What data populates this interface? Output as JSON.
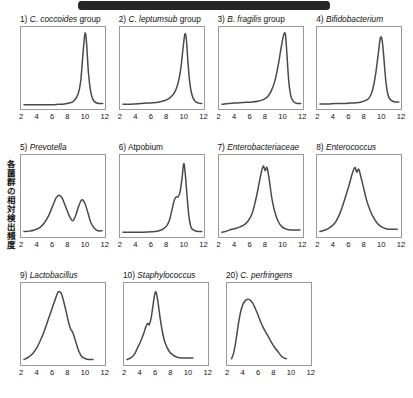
{
  "figure": {
    "y_axis_label": "各菌群の相対検出頻度",
    "x_ticks": [
      "2",
      "4",
      "6",
      "8",
      "10",
      "12"
    ],
    "curve_color": "#4a4a4a",
    "frame_color": "#9a9a9a",
    "artifact_color": "#262626"
  },
  "chart_data": {
    "type": "line",
    "title": "",
    "xlabel": "",
    "ylabel": "各菌群の相対検出頻度",
    "xlim": [
      1.4,
      12.6
    ],
    "ylim": [
      0,
      1
    ],
    "grid": false,
    "legend": "none",
    "panel_layout": [
      4,
      4,
      3
    ],
    "panels": [
      {
        "index": "1)",
        "taxon": "C. coccoides",
        "suffix": " group",
        "italic_part": "C. coccoides",
        "x": [
          1.8,
          2.5,
          3.2,
          4.0,
          4.8,
          5.6,
          6.4,
          7.2,
          8.0,
          8.5,
          9.0,
          9.35,
          9.6,
          9.85,
          10.0,
          10.15,
          10.4,
          10.7,
          11.0,
          11.4,
          11.9,
          12.3
        ],
        "y": [
          0.035,
          0.035,
          0.035,
          0.035,
          0.035,
          0.035,
          0.04,
          0.045,
          0.06,
          0.09,
          0.17,
          0.33,
          0.62,
          0.9,
          0.96,
          0.82,
          0.44,
          0.2,
          0.1,
          0.06,
          0.05,
          0.05
        ]
      },
      {
        "index": "2)",
        "taxon": "C. leptumsub",
        "suffix": " group",
        "italic_part": "C. leptumsub",
        "x": [
          1.8,
          2.6,
          3.4,
          4.2,
          5.0,
          5.8,
          6.6,
          7.4,
          8.0,
          8.6,
          9.1,
          9.5,
          9.8,
          10.05,
          10.25,
          10.45,
          10.7,
          11.0,
          11.4,
          11.9,
          12.3
        ],
        "y": [
          0.04,
          0.04,
          0.045,
          0.05,
          0.055,
          0.06,
          0.07,
          0.09,
          0.12,
          0.18,
          0.3,
          0.5,
          0.76,
          0.95,
          0.88,
          0.6,
          0.32,
          0.16,
          0.08,
          0.055,
          0.05
        ]
      },
      {
        "index": "3)",
        "taxon": "B. fragilis",
        "suffix": " group",
        "italic_part": "B. fragilis",
        "x": [
          1.8,
          2.6,
          3.4,
          4.2,
          5.0,
          5.8,
          6.6,
          7.3,
          7.9,
          8.4,
          8.9,
          9.3,
          9.7,
          10.0,
          10.25,
          10.45,
          10.7,
          11.0,
          11.4,
          11.9,
          12.3
        ],
        "y": [
          0.04,
          0.05,
          0.055,
          0.06,
          0.065,
          0.07,
          0.08,
          0.1,
          0.14,
          0.22,
          0.36,
          0.55,
          0.78,
          0.93,
          0.95,
          0.7,
          0.34,
          0.14,
          0.07,
          0.05,
          0.05
        ]
      },
      {
        "index": "4)",
        "taxon": "Bifidobacterium",
        "suffix": "",
        "italic_part": "Bifidobacterium",
        "x": [
          1.8,
          2.8,
          3.8,
          4.8,
          5.8,
          6.6,
          7.3,
          7.9,
          8.4,
          8.8,
          9.2,
          9.55,
          9.85,
          10.1,
          10.35,
          10.6,
          10.9,
          11.3,
          11.8,
          12.3
        ],
        "y": [
          0.045,
          0.045,
          0.05,
          0.05,
          0.055,
          0.06,
          0.07,
          0.09,
          0.13,
          0.22,
          0.42,
          0.68,
          0.9,
          0.86,
          0.6,
          0.32,
          0.15,
          0.09,
          0.07,
          0.07
        ]
      },
      {
        "index": "5)",
        "taxon": "Prevotella",
        "suffix": "",
        "italic_part": "Prevotella",
        "x": [
          1.8,
          2.5,
          3.2,
          3.9,
          4.5,
          5.1,
          5.7,
          6.1,
          6.5,
          6.9,
          7.4,
          7.9,
          8.3,
          8.7,
          9.1,
          9.5,
          9.9,
          10.3,
          10.7,
          11.2,
          11.7,
          12.2
        ],
        "y": [
          0.05,
          0.055,
          0.07,
          0.1,
          0.16,
          0.26,
          0.4,
          0.49,
          0.52,
          0.48,
          0.36,
          0.24,
          0.19,
          0.26,
          0.38,
          0.46,
          0.42,
          0.3,
          0.17,
          0.09,
          0.06,
          0.06
        ]
      },
      {
        "index": "6)",
        "taxon": "",
        "suffix": "Atpobium",
        "italic_part": "",
        "x": [
          1.8,
          3.0,
          4.2,
          5.2,
          6.0,
          6.6,
          7.1,
          7.6,
          8.0,
          8.35,
          8.65,
          8.9,
          9.15,
          9.4,
          9.65,
          9.9,
          10.1,
          10.35,
          10.6,
          10.9,
          11.4,
          12.0,
          12.3
        ],
        "y": [
          0.04,
          0.04,
          0.04,
          0.045,
          0.05,
          0.06,
          0.08,
          0.12,
          0.2,
          0.34,
          0.46,
          0.5,
          0.5,
          0.56,
          0.72,
          0.93,
          0.8,
          0.5,
          0.24,
          0.1,
          0.06,
          0.05,
          0.05
        ]
      },
      {
        "index": "7)",
        "taxon": "Enterobacteriaceae",
        "suffix": "",
        "italic_part": "Enterobacteriaceae",
        "x": [
          1.8,
          2.4,
          3.0,
          3.6,
          4.2,
          4.8,
          5.3,
          5.8,
          6.2,
          6.6,
          7.0,
          7.3,
          7.55,
          7.8,
          8.1,
          8.45,
          8.85,
          9.3,
          9.8,
          10.4,
          11.0,
          11.6,
          12.2
        ],
        "y": [
          0.04,
          0.055,
          0.075,
          0.09,
          0.11,
          0.14,
          0.19,
          0.28,
          0.42,
          0.6,
          0.8,
          0.9,
          0.84,
          0.88,
          0.72,
          0.48,
          0.3,
          0.18,
          0.11,
          0.08,
          0.07,
          0.07,
          0.07
        ]
      },
      {
        "index": "8)",
        "taxon": "Enterococcus",
        "suffix": "",
        "italic_part": "Enterococcus",
        "x": [
          1.8,
          2.5,
          3.1,
          3.7,
          4.2,
          4.7,
          5.2,
          5.7,
          6.1,
          6.45,
          6.7,
          6.95,
          7.2,
          7.6,
          8.0,
          8.5,
          9.0,
          9.5,
          10.0,
          10.5,
          11.0,
          11.5,
          12.1
        ],
        "y": [
          0.05,
          0.07,
          0.1,
          0.15,
          0.23,
          0.35,
          0.5,
          0.66,
          0.8,
          0.88,
          0.82,
          0.86,
          0.78,
          0.62,
          0.46,
          0.32,
          0.22,
          0.15,
          0.11,
          0.09,
          0.08,
          0.08,
          0.08
        ]
      },
      {
        "index": "9)",
        "taxon": "Lactobacillus",
        "suffix": "",
        "italic_part": "Lactobacillus",
        "x": [
          1.8,
          2.4,
          3.0,
          3.5,
          4.0,
          4.5,
          5.0,
          5.5,
          6.0,
          6.4,
          6.8,
          7.1,
          7.4,
          7.7,
          8.0,
          8.3,
          8.7,
          9.1,
          9.5,
          10.0,
          10.5,
          11.0
        ],
        "y": [
          0.05,
          0.08,
          0.13,
          0.2,
          0.3,
          0.42,
          0.56,
          0.7,
          0.84,
          0.93,
          0.9,
          0.8,
          0.68,
          0.55,
          0.45,
          0.4,
          0.28,
          0.16,
          0.09,
          0.06,
          0.05,
          0.05
        ]
      },
      {
        "index": "10)",
        "taxon": "Staphylococcus",
        "suffix": "",
        "italic_part": "Staphylococcus",
        "x": [
          1.8,
          2.3,
          2.8,
          3.2,
          3.6,
          4.0,
          4.3,
          4.55,
          4.75,
          5.0,
          5.25,
          5.5,
          5.7,
          5.95,
          6.2,
          6.5,
          6.9,
          7.4,
          7.9,
          8.5,
          9.2,
          10.0,
          10.6
        ],
        "y": [
          0.05,
          0.07,
          0.12,
          0.2,
          0.28,
          0.38,
          0.47,
          0.52,
          0.5,
          0.58,
          0.74,
          0.9,
          0.92,
          0.78,
          0.6,
          0.42,
          0.26,
          0.16,
          0.11,
          0.08,
          0.07,
          0.07,
          0.07
        ]
      },
      {
        "index": "20)",
        "taxon": "C. perfringens",
        "suffix": "",
        "italic_part": "C. perfringens",
        "x": [
          2.0,
          2.3,
          2.6,
          2.9,
          3.2,
          3.5,
          3.9,
          4.3,
          4.7,
          5.0,
          5.4,
          5.8,
          6.2,
          6.6,
          7.0,
          7.4,
          7.8,
          8.2,
          8.6,
          9.0,
          9.3
        ],
        "y": [
          0.06,
          0.14,
          0.3,
          0.5,
          0.66,
          0.76,
          0.82,
          0.83,
          0.8,
          0.75,
          0.66,
          0.56,
          0.47,
          0.4,
          0.33,
          0.26,
          0.2,
          0.15,
          0.1,
          0.07,
          0.06
        ]
      }
    ]
  }
}
